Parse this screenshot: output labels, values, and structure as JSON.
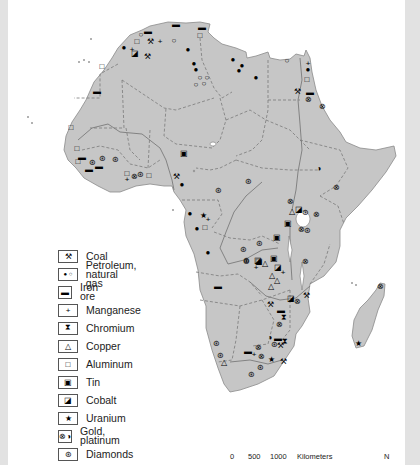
{
  "map": {
    "land_color": "#c6c6c6",
    "water_color": "#ffffff",
    "frame_color": "#e2e2e2"
  },
  "legend": {
    "items": [
      {
        "symbol": "⚒",
        "icon": "coal-icon",
        "label": "Coal"
      },
      {
        "symbol": "● ○",
        "icon": "petroleum-gas-icon",
        "label": "Petroleum,\nnatural gas"
      },
      {
        "symbol": "▬",
        "icon": "iron-ore-icon",
        "label": "Iron ore"
      },
      {
        "symbol": "+",
        "icon": "manganese-icon",
        "label": "Manganese"
      },
      {
        "symbol": "⧗",
        "icon": "chromium-icon",
        "label": "Chromium"
      },
      {
        "symbol": "△",
        "icon": "copper-icon",
        "label": "Copper"
      },
      {
        "symbol": "□",
        "icon": "aluminum-icon",
        "label": "Aluminum"
      },
      {
        "symbol": "▣",
        "icon": "tin-icon",
        "label": "Tin"
      },
      {
        "symbol": "◪",
        "icon": "cobalt-icon",
        "label": "Cobalt"
      },
      {
        "symbol": "★",
        "icon": "uranium-icon",
        "label": "Uranium"
      },
      {
        "symbol": "⊗◑",
        "icon": "gold-platinum-icon",
        "label": "Gold, platinum"
      },
      {
        "symbol": "⊛",
        "icon": "diamonds-icon",
        "label": "Diamonds"
      }
    ]
  },
  "scale_bar": {
    "ticks": [
      "0",
      "500",
      "1000"
    ],
    "unit": "Kilometers",
    "north": "N"
  },
  "symbols": [
    {
      "s": "▬",
      "x": 176,
      "y": 25
    },
    {
      "s": "▬",
      "x": 202,
      "y": 28
    },
    {
      "s": "□",
      "x": 200,
      "y": 36
    },
    {
      "s": "▬",
      "x": 148,
      "y": 32
    },
    {
      "s": "○",
      "x": 141,
      "y": 35
    },
    {
      "s": "□",
      "x": 137,
      "y": 42
    },
    {
      "s": "⚒",
      "x": 150,
      "y": 42
    },
    {
      "s": "+",
      "x": 160,
      "y": 42
    },
    {
      "s": "○",
      "x": 174,
      "y": 41
    },
    {
      "s": "●",
      "x": 124,
      "y": 48
    },
    {
      "s": "+",
      "x": 132,
      "y": 50
    },
    {
      "s": "◪",
      "x": 135,
      "y": 54
    },
    {
      "s": "⚒",
      "x": 147,
      "y": 57
    },
    {
      "s": "●",
      "x": 188,
      "y": 50
    },
    {
      "s": "●",
      "x": 194,
      "y": 64
    },
    {
      "s": "●",
      "x": 196,
      "y": 70
    },
    {
      "s": "○",
      "x": 200,
      "y": 78
    },
    {
      "s": "○",
      "x": 207,
      "y": 78
    },
    {
      "s": "○",
      "x": 196,
      "y": 85
    },
    {
      "s": "○",
      "x": 204,
      "y": 84
    },
    {
      "s": "●",
      "x": 233,
      "y": 60
    },
    {
      "s": "●",
      "x": 242,
      "y": 66
    },
    {
      "s": "●",
      "x": 239,
      "y": 71
    },
    {
      "s": "●",
      "x": 256,
      "y": 78
    },
    {
      "s": "○",
      "x": 287,
      "y": 61
    },
    {
      "s": "+",
      "x": 308,
      "y": 64
    },
    {
      "s": "●",
      "x": 308,
      "y": 70
    },
    {
      "s": "□",
      "x": 307,
      "y": 80
    },
    {
      "s": "⚒",
      "x": 297,
      "y": 92
    },
    {
      "s": "▬",
      "x": 310,
      "y": 93
    },
    {
      "s": "⊗",
      "x": 308,
      "y": 100
    },
    {
      "s": "⊗",
      "x": 322,
      "y": 107
    },
    {
      "s": "□",
      "x": 102,
      "y": 67
    },
    {
      "s": "▬",
      "x": 97,
      "y": 92
    },
    {
      "s": "□",
      "x": 71,
      "y": 128
    },
    {
      "s": "□",
      "x": 77,
      "y": 149
    },
    {
      "s": "□",
      "x": 78,
      "y": 162
    },
    {
      "s": "▬",
      "x": 82,
      "y": 158
    },
    {
      "s": "⊛",
      "x": 92,
      "y": 163
    },
    {
      "s": "▬",
      "x": 89,
      "y": 170
    },
    {
      "s": "▬",
      "x": 99,
      "y": 167
    },
    {
      "s": "⊛",
      "x": 102,
      "y": 159
    },
    {
      "s": "⊛",
      "x": 115,
      "y": 160
    },
    {
      "s": "▣",
      "x": 184,
      "y": 154
    },
    {
      "s": "□",
      "x": 127,
      "y": 174
    },
    {
      "s": "+",
      "x": 127,
      "y": 180
    },
    {
      "s": "⊗",
      "x": 134,
      "y": 177
    },
    {
      "s": "⊛",
      "x": 140,
      "y": 175
    },
    {
      "s": "□",
      "x": 149,
      "y": 176
    },
    {
      "s": "⚒",
      "x": 176,
      "y": 177
    },
    {
      "s": "●",
      "x": 182,
      "y": 185
    },
    {
      "s": "⊛",
      "x": 248,
      "y": 182
    },
    {
      "s": "⊛",
      "x": 218,
      "y": 191
    },
    {
      "s": "◑",
      "x": 319,
      "y": 169
    },
    {
      "s": "⊗",
      "x": 336,
      "y": 188
    },
    {
      "s": "⊗",
      "x": 290,
      "y": 202
    },
    {
      "s": "△",
      "x": 292,
      "y": 212
    },
    {
      "s": "◪",
      "x": 299,
      "y": 210
    },
    {
      "s": "⊛",
      "x": 305,
      "y": 213
    },
    {
      "s": "⊗",
      "x": 316,
      "y": 215
    },
    {
      "s": "▣",
      "x": 288,
      "y": 224
    },
    {
      "s": "⊗",
      "x": 301,
      "y": 230
    },
    {
      "s": "⊛",
      "x": 307,
      "y": 231
    },
    {
      "s": "●",
      "x": 190,
      "y": 214
    },
    {
      "s": "★",
      "x": 203,
      "y": 216
    },
    {
      "s": "+",
      "x": 208,
      "y": 220
    },
    {
      "s": "●",
      "x": 197,
      "y": 229
    },
    {
      "s": "□",
      "x": 205,
      "y": 228
    },
    {
      "s": "●",
      "x": 208,
      "y": 253
    },
    {
      "s": "⊛",
      "x": 243,
      "y": 250
    },
    {
      "s": "⊛",
      "x": 259,
      "y": 244
    },
    {
      "s": "▣",
      "x": 277,
      "y": 238
    },
    {
      "s": "⊛",
      "x": 246,
      "y": 261
    },
    {
      "s": "◪",
      "x": 258,
      "y": 261
    },
    {
      "s": "△",
      "x": 265,
      "y": 264
    },
    {
      "s": "▣",
      "x": 274,
      "y": 259
    },
    {
      "s": "⊗",
      "x": 305,
      "y": 262
    },
    {
      "s": "◪",
      "x": 278,
      "y": 268
    },
    {
      "s": "+",
      "x": 256,
      "y": 268
    },
    {
      "s": "⊛",
      "x": 246,
      "y": 262
    },
    {
      "s": "◪",
      "x": 259,
      "y": 262
    },
    {
      "s": "△",
      "x": 272,
      "y": 276
    },
    {
      "s": "△",
      "x": 277,
      "y": 281
    },
    {
      "s": "+",
      "x": 283,
      "y": 273
    },
    {
      "s": "△",
      "x": 271,
      "y": 287
    },
    {
      "s": "▬",
      "x": 218,
      "y": 287
    },
    {
      "s": "◪",
      "x": 291,
      "y": 299
    },
    {
      "s": "⊗",
      "x": 297,
      "y": 302
    },
    {
      "s": "⚒",
      "x": 306,
      "y": 296
    },
    {
      "s": "⚒",
      "x": 270,
      "y": 305
    },
    {
      "s": "▬",
      "x": 281,
      "y": 311
    },
    {
      "s": "⧗",
      "x": 284,
      "y": 318
    },
    {
      "s": "⊗",
      "x": 279,
      "y": 325
    },
    {
      "s": "◑",
      "x": 270,
      "y": 338
    },
    {
      "s": "▬",
      "x": 278,
      "y": 339
    },
    {
      "s": "⧗",
      "x": 285,
      "y": 342
    },
    {
      "s": "⊛",
      "x": 274,
      "y": 345
    },
    {
      "s": "⚒",
      "x": 280,
      "y": 346
    },
    {
      "s": "▬",
      "x": 248,
      "y": 352
    },
    {
      "s": "+",
      "x": 254,
      "y": 355
    },
    {
      "s": "⊗",
      "x": 258,
      "y": 348
    },
    {
      "s": "⊗",
      "x": 261,
      "y": 357
    },
    {
      "s": "★",
      "x": 271,
      "y": 360
    },
    {
      "s": "⚒",
      "x": 283,
      "y": 362
    },
    {
      "s": "⊛",
      "x": 216,
      "y": 344
    },
    {
      "s": "⊛",
      "x": 220,
      "y": 356
    },
    {
      "s": "△",
      "x": 224,
      "y": 363
    },
    {
      "s": "⊛",
      "x": 260,
      "y": 368
    },
    {
      "s": "⊛",
      "x": 251,
      "y": 375
    },
    {
      "s": "⊗",
      "x": 380,
      "y": 287
    },
    {
      "s": "★",
      "x": 358,
      "y": 344
    }
  ]
}
